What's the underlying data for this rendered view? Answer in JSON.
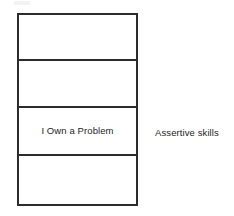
{
  "diagram": {
    "type": "stacked-rows-with-side-label",
    "background_color": "#ffffff",
    "line_color": "#2c2c2c",
    "text_color": "#1e1e1e",
    "stack": {
      "name": "four-row-stack",
      "rows": [
        {
          "index": 1,
          "label": ""
        },
        {
          "index": 2,
          "label": ""
        },
        {
          "index": 3,
          "label": "I Own a Problem"
        },
        {
          "index": 4,
          "label": ""
        }
      ]
    },
    "annotations": [
      {
        "name": "assertive-skills-label",
        "text": "Assertive skills",
        "aligned_to_row": 3
      }
    ]
  }
}
